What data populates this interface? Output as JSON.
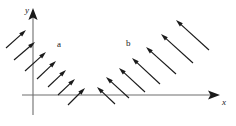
{
  "figure": {
    "type": "vector-field-diagram",
    "background_color": "#ffffff",
    "stroke_color": "#1a1a1a",
    "axis_color": "#6e6e6e",
    "width": 236,
    "height": 126
  },
  "axes": {
    "x": {
      "label": "x",
      "label_x": 222,
      "label_y": 105,
      "line": {
        "x1": 22,
        "y1": 95,
        "x2": 214,
        "y2": 95
      },
      "arrow_tip_x": 220,
      "arrow_tip_y": 95
    },
    "y": {
      "label": "y",
      "label_x": 25,
      "label_y": 13,
      "line": {
        "x1": 33,
        "y1": 115,
        "x2": 33,
        "y2": 16
      },
      "arrow_tip_x": 33,
      "arrow_tip_y": 8
    }
  },
  "field_labels": [
    {
      "text": "a",
      "x": 57,
      "y": 47
    },
    {
      "text": "b",
      "x": 126,
      "y": 46
    }
  ],
  "chart_data": {
    "type": "scatter",
    "title": "",
    "xlabel": "x",
    "ylabel": "y",
    "series": [
      {
        "name": "a",
        "direction": "up-right",
        "angle_deg": 52,
        "arrows": [
          {
            "x1": 6,
            "y1": 48,
            "x2": 26,
            "y2": 30
          },
          {
            "x1": 14,
            "y1": 60,
            "x2": 35,
            "y2": 42
          },
          {
            "x1": 25,
            "y1": 71,
            "x2": 46,
            "y2": 52
          },
          {
            "x1": 37,
            "y1": 79,
            "x2": 56,
            "y2": 61
          },
          {
            "x1": 48,
            "y1": 87,
            "x2": 66,
            "y2": 70
          },
          {
            "x1": 58,
            "y1": 95,
            "x2": 75,
            "y2": 79
          },
          {
            "x1": 68,
            "y1": 105,
            "x2": 85,
            "y2": 88
          }
        ]
      },
      {
        "name": "b",
        "direction": "up-left",
        "angle_deg": 128,
        "arrows": [
          {
            "x1": 115,
            "y1": 104,
            "x2": 97,
            "y2": 87
          },
          {
            "x1": 129,
            "y1": 98,
            "x2": 106,
            "y2": 77
          },
          {
            "x1": 145,
            "y1": 92,
            "x2": 119,
            "y2": 68
          },
          {
            "x1": 160,
            "y1": 84,
            "x2": 132,
            "y2": 58
          },
          {
            "x1": 176,
            "y1": 74,
            "x2": 146,
            "y2": 47
          },
          {
            "x1": 193,
            "y1": 63,
            "x2": 161,
            "y2": 34
          },
          {
            "x1": 209,
            "y1": 50,
            "x2": 176,
            "y2": 20
          }
        ]
      }
    ]
  }
}
